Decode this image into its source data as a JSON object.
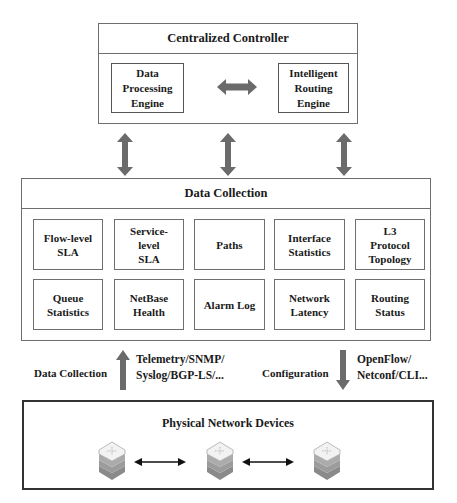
{
  "controller": {
    "title": "Centralized Controller",
    "modules": [
      {
        "label": "Data\nProcessing\nEngine"
      },
      {
        "label": "Intelligent\nRouting\nEngine"
      }
    ],
    "link_icon": "bidirectional-horizontal-arrow"
  },
  "interlayer_links": {
    "icon": "bidirectional-vertical-arrow",
    "count": 3,
    "color": "#6b6b6b"
  },
  "data_collection": {
    "title": "Data Collection",
    "items": [
      {
        "label": "Flow-level\nSLA"
      },
      {
        "label": "Service-\nlevel\nSLA"
      },
      {
        "label": "Paths"
      },
      {
        "label": "Interface\nStatistics"
      },
      {
        "label": "L3\nProtocol\nTopology"
      },
      {
        "label": "Queue\nStatistics"
      },
      {
        "label": "NetBase\nHealth"
      },
      {
        "label": "Alarm Log"
      },
      {
        "label": "Network\nLatency"
      },
      {
        "label": "Routing\nStatus"
      }
    ]
  },
  "southbound": {
    "upward": {
      "label": "Data Collection",
      "protocols": "Telemetry/SNMP/\nSyslog/BGP-LS/...",
      "icon": "up-arrow"
    },
    "downward": {
      "label": "Configuration",
      "protocols": "OpenFlow/\nNetconf/CLI...",
      "icon": "down-arrow"
    }
  },
  "physical": {
    "title": "Physical Network Devices",
    "devices": [
      {
        "icon": "router-stack-icon"
      },
      {
        "icon": "router-stack-icon"
      },
      {
        "icon": "router-stack-icon"
      }
    ],
    "link_icon": "double-headed-arrow"
  }
}
